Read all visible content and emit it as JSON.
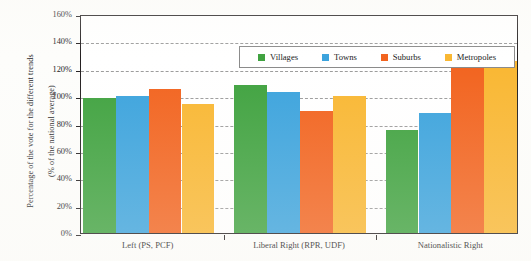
{
  "chart_data": {
    "type": "bar",
    "title": "",
    "subtitle": "",
    "xlabel": "",
    "ylabel": "Percentage of the vote for the different trends (% of the national average)",
    "ylabel_line1": "Percentage of the vote for the different trends",
    "ylabel_line2": "(% of the national average)",
    "categories": [
      "Left (PS, PCF)",
      "Liberal Right (RPR, UDF)",
      "Nationalistic Right"
    ],
    "series": [
      {
        "name": "Villages",
        "color": "#3FA23F",
        "values": [
          99,
          108,
          75
        ]
      },
      {
        "name": "Towns",
        "color": "#3BA3DD",
        "values": [
          100,
          103,
          88
        ]
      },
      {
        "name": "Suburbs",
        "color": "#F2631E",
        "values": [
          105,
          89,
          124
        ]
      },
      {
        "name": "Metropoles",
        "color": "#F9B732",
        "values": [
          94,
          100,
          126
        ]
      }
    ],
    "ylim": [
      0,
      160
    ],
    "ytick_values": [
      0,
      20,
      40,
      60,
      80,
      100,
      120,
      140,
      160
    ],
    "ytick_labels": [
      "0%",
      "20%",
      "40%",
      "60%",
      "80%",
      "100%",
      "120%",
      "140%",
      "160%"
    ],
    "yunit": "%",
    "grid": "horizontal-dashed",
    "legend_position": "top-center-inside",
    "legend_entries": [
      "Villages",
      "Towns",
      "Suburbs",
      "Metropoles"
    ],
    "bar_value_labels_shown": false,
    "background_color": "#ffffff",
    "axis_color": "#231f20",
    "gridline_color": "#9b9b9b"
  }
}
